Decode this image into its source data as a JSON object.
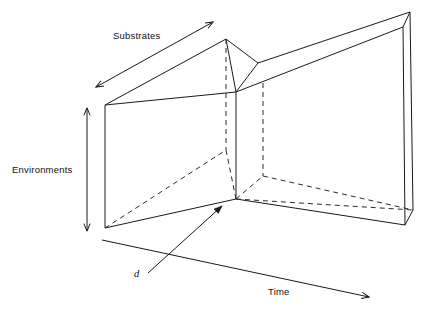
{
  "figure": {
    "title": "",
    "type": "3d-schematic-diagram",
    "background_color": "#ffffff",
    "line_color": "#1a1a1a",
    "labels": {
      "substrates": "Substrates",
      "environments": "Environments",
      "time": "Time",
      "depth": "d"
    },
    "axes": [
      {
        "name": "substrates",
        "label": "Substrates",
        "arrow_heads": "both",
        "direction": "lower-left-to-upper-right"
      },
      {
        "name": "environments",
        "label": "Environments",
        "arrow_heads": "both",
        "direction": "vertical"
      },
      {
        "name": "time",
        "label": "Time",
        "arrow_heads": "single",
        "direction": "left-to-right-descending"
      },
      {
        "name": "depth",
        "label": "d",
        "arrow_heads": "single",
        "direction": "lower-left-to-upper-right"
      }
    ],
    "geometry": {
      "description": "Two folded planar slabs meeting at a central vertical fold, drawn in oblique projection with hidden edges dashed.",
      "apex_peak": [
        226,
        39
      ],
      "top_right_corner": [
        410,
        12
      ],
      "fold_top": [
        236,
        92
      ],
      "fold_bottom": [
        236,
        199
      ],
      "left_plane_top_left": [
        105,
        105
      ],
      "left_plane_bottom_left": [
        105,
        228
      ],
      "right_plane_bottom_right": [
        405,
        225
      ]
    }
  }
}
